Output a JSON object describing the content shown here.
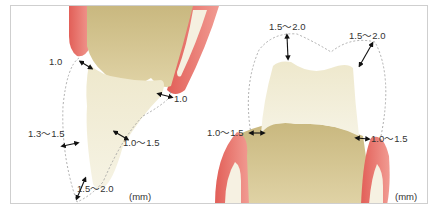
{
  "figure": {
    "unit_label": "(mm)",
    "colors": {
      "gingiva": "#e8736c",
      "gingiva_light": "#f4b1a8",
      "tooth_root": "#d8c897",
      "crown_prep": "#f3efd8",
      "dashed_outline": "#9a9a9a",
      "arrow": "#111111",
      "border": "#cfcfcf"
    }
  },
  "anterior": {
    "name": "anterior-tooth-preparation",
    "labels": {
      "incisal_left_top": "1.0",
      "cervical_right": "1.0",
      "labial": "1.3～1.5",
      "lingual": "1.0～1.5",
      "incisal_edge": "1.5～2.0"
    },
    "unit": "(mm)"
  },
  "posterior": {
    "name": "posterior-tooth-preparation",
    "labels": {
      "occlusal_left": "1.5～2.0",
      "occlusal_right": "1.5～2.0",
      "cervical_left": "1.0～1.5",
      "cervical_right": "1.0～1.5"
    },
    "unit": "(mm)"
  }
}
